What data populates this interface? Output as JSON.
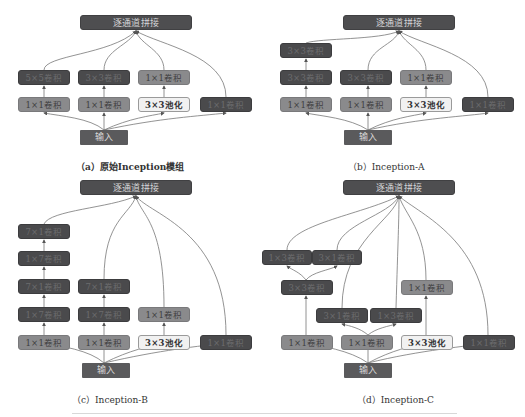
{
  "labels": {
    "concat": "逐通道拼接",
    "input": "输入",
    "conv1x1": "1×1卷积",
    "conv3x3": "3×3卷积",
    "conv5x5": "5×5卷积",
    "conv1x7": "1×7卷积",
    "conv7x1": "7×1卷积",
    "conv1x3": "1×3卷积",
    "conv3x1": "3×1卷积",
    "pool3x3": "3×3池化"
  },
  "panels": {
    "a": {
      "caption": "（a）原始Inception模组",
      "branches": [
        [
          "1×1卷积",
          "5×5卷积"
        ],
        [
          "1×1卷积",
          "3×3卷积"
        ],
        [
          "3×3池化",
          "1×1卷积"
        ],
        [
          "1×1卷积"
        ]
      ]
    },
    "b": {
      "caption": "（b）Inception-A",
      "branches": [
        [
          "1×1卷积",
          "3×3卷积",
          "3×3卷积"
        ],
        [
          "1×1卷积",
          "3×3卷积"
        ],
        [
          "3×3池化",
          "1×1卷积"
        ],
        [
          "1×1卷积"
        ]
      ]
    },
    "c": {
      "caption": "（c）Inception-B",
      "branches": [
        [
          "1×1卷积",
          "1×7卷积",
          "7×1卷积",
          "1×7卷积",
          "7×1卷积"
        ],
        [
          "1×1卷积",
          "1×7卷积",
          "7×1卷积"
        ],
        [
          "3×3池化",
          "1×1卷积"
        ],
        [
          "1×1卷积"
        ]
      ]
    },
    "d": {
      "caption": "（d）Inception-C",
      "branches": [
        [
          "1×1卷积",
          "3×3卷积",
          [
            "1×3卷积",
            "3×1卷积"
          ]
        ],
        [
          "1×1卷积",
          [
            "3×1卷积",
            "1×3卷积"
          ]
        ],
        [
          "3×3池化",
          "1×1卷积"
        ],
        [
          "1×1卷积"
        ]
      ]
    }
  },
  "colors": {
    "dark_box": "#4a4a4c",
    "mid_box": "#8a8a8c",
    "pool_box": "#f1f1f1",
    "concat_box": "#4e4e50",
    "input_box": "#5a5a5c",
    "wire": "#6a6a6a"
  }
}
